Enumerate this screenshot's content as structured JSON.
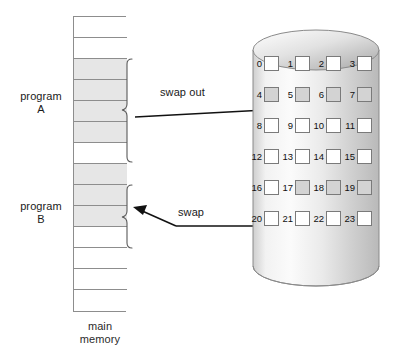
{
  "diagram": {
    "main_memory": {
      "caption": "main\nmemory",
      "cell_count": 14,
      "cells": [
        {
          "index": 0,
          "state": "free"
        },
        {
          "index": 1,
          "state": "free"
        },
        {
          "index": 2,
          "state": "occupied"
        },
        {
          "index": 3,
          "state": "occupied"
        },
        {
          "index": 4,
          "state": "occupied"
        },
        {
          "index": 5,
          "state": "occupied"
        },
        {
          "index": 6,
          "state": "free"
        },
        {
          "index": 7,
          "state": "occupied"
        },
        {
          "index": 8,
          "state": "occupied"
        },
        {
          "index": 9,
          "state": "occupied"
        },
        {
          "index": 10,
          "state": "free"
        },
        {
          "index": 11,
          "state": "free"
        },
        {
          "index": 12,
          "state": "free"
        },
        {
          "index": 13,
          "state": "free"
        }
      ]
    },
    "programs": [
      {
        "id": "a",
        "label": "program\nA",
        "cells": [
          2,
          3,
          4,
          5
        ]
      },
      {
        "id": "b",
        "label": "program\nB",
        "cells": [
          7,
          8,
          9
        ]
      }
    ],
    "arrows": [
      {
        "id": "swap-out",
        "label": "swap out",
        "direction": "memory-to-disk",
        "targets": [
          4,
          5,
          6,
          7
        ]
      },
      {
        "id": "swap-in",
        "label": "swap",
        "direction": "disk-to-memory",
        "sources": [
          17,
          18,
          19
        ]
      }
    ],
    "disk": {
      "shape": "cylinder",
      "columns": 4,
      "rows": 6,
      "blocks": [
        {
          "num": "0",
          "state": "free"
        },
        {
          "num": "1",
          "state": "free"
        },
        {
          "num": "2",
          "state": "free"
        },
        {
          "num": "3",
          "state": "free"
        },
        {
          "num": "4",
          "state": "used"
        },
        {
          "num": "5",
          "state": "used"
        },
        {
          "num": "6",
          "state": "used"
        },
        {
          "num": "7",
          "state": "used"
        },
        {
          "num": "8",
          "state": "free"
        },
        {
          "num": "9",
          "state": "free"
        },
        {
          "num": "10",
          "state": "free"
        },
        {
          "num": "11",
          "state": "free"
        },
        {
          "num": "12",
          "state": "free"
        },
        {
          "num": "13",
          "state": "free"
        },
        {
          "num": "14",
          "state": "free"
        },
        {
          "num": "15",
          "state": "free"
        },
        {
          "num": "16",
          "state": "free"
        },
        {
          "num": "17",
          "state": "used"
        },
        {
          "num": "18",
          "state": "used"
        },
        {
          "num": "19",
          "state": "used"
        },
        {
          "num": "20",
          "state": "free"
        },
        {
          "num": "21",
          "state": "free"
        },
        {
          "num": "22",
          "state": "free"
        },
        {
          "num": "23",
          "state": "free"
        }
      ]
    },
    "colors": {
      "occupied_memory": "#e6e6e6",
      "used_block": "#d3d3d3",
      "free_block": "#ffffff",
      "outline": "#8d8d8d",
      "line": "#111111",
      "text": "#1a1a1a"
    }
  }
}
